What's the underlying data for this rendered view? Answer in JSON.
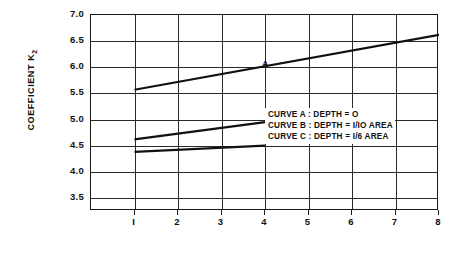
{
  "chart_data": {
    "type": "line",
    "title": "",
    "subtitle": "",
    "xlabel": "",
    "ylabel": "COEFFICIENT K",
    "ylabel_sub": "2",
    "xlim": [
      0,
      8
    ],
    "ylim": [
      3.25,
      7.0
    ],
    "grid": true,
    "legend_position": "inside-center-right",
    "y_ticks": [
      "7.0",
      "6.5",
      "6.0",
      "5.5",
      "5.0",
      "4.5",
      "4.0",
      "3.5"
    ],
    "y_tick_values": [
      7.0,
      6.5,
      6.0,
      5.5,
      5.0,
      4.5,
      4.0,
      3.5
    ],
    "x_ticks": [
      "I",
      "2",
      "3",
      "4",
      "5",
      "6",
      "7",
      "8"
    ],
    "x_tick_values": [
      1,
      2,
      3,
      4,
      5,
      6,
      7,
      8
    ],
    "series": [
      {
        "name": "A",
        "label": "A",
        "x": [
          1,
          8
        ],
        "values": [
          5.57,
          6.62
        ],
        "color": "#111111",
        "label_x": 4.0,
        "label_y": 6.05
      },
      {
        "name": "B",
        "label": "B",
        "x": [
          1,
          4
        ],
        "values": [
          4.62,
          4.95
        ],
        "color": "#111111",
        "label_x": 4.45,
        "label_y": 5.05
      },
      {
        "name": "C",
        "label": "C",
        "x": [
          1,
          4
        ],
        "values": [
          4.38,
          4.5
        ],
        "color": "#111111",
        "label_x": 4.45,
        "label_y": 4.62
      }
    ],
    "annotations": [
      "CURVE  A : DEPTH = O",
      "CURVE  B : DEPTH = I/IO AREA",
      "CURVE  C : DEPTH = I/6 AREA"
    ]
  },
  "legend": {
    "line1": "CURVE  A : DEPTH = O",
    "line2": "CURVE  B : DEPTH = I/IO AREA",
    "line3": "CURVE  C : DEPTH = I/6 AREA"
  },
  "axis": {
    "y_title": "COEFFICIENT K",
    "y_title_sub": "2"
  }
}
